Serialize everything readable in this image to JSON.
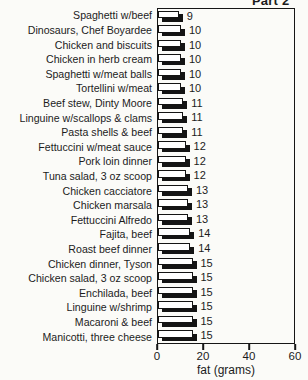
{
  "title": "Part 2",
  "chart_data": {
    "type": "bar",
    "orientation": "horizontal",
    "title": "Part 2",
    "xlabel": "fat (grams)",
    "ylabel": "",
    "xlim": [
      0,
      60
    ],
    "xticks": [
      0,
      20,
      40,
      60
    ],
    "grid": false,
    "value_labels_shown": true,
    "legend": "none",
    "bar_style": "white bars with black outline and black drop shadow, values labeled at bar ends",
    "categories": [
      "Spaghetti w/beef",
      "Dinosaurs, Chef Boyardee",
      "Chicken and biscuits",
      "Chicken in herb cream",
      "Spaghetti w/meat balls",
      "Tortellini w/meat",
      "Beef stew, Dinty Moore",
      "Linguine w/scallops & clams",
      "Pasta shells & beef",
      "Fettuccini w/meat sauce",
      "Pork loin dinner",
      "Tuna salad, 3 oz scoop",
      "Chicken cacciatore",
      "Chicken marsala",
      "Fettuccini Alfredo",
      "Fajita, beef",
      "Roast beef dinner",
      "Chicken dinner, Tyson",
      "Chicken salad, 3 oz scoop",
      "Enchilada, beef",
      "Linguine w/shrimp",
      "Macaroni & beef",
      "Manicotti, three cheese"
    ],
    "values": [
      9,
      10,
      10,
      10,
      10,
      10,
      11,
      11,
      11,
      12,
      12,
      12,
      13,
      13,
      13,
      14,
      14,
      15,
      15,
      15,
      15,
      15,
      15
    ]
  },
  "colors": {
    "background": "#fbfbf8",
    "bar_face": "#ffffff",
    "bar_outline": "#141414",
    "bar_shadow": "#141414",
    "axis": "#161616",
    "text": "#1c1c1c"
  }
}
